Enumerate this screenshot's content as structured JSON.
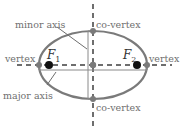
{
  "diagram": {
    "colors": {
      "ellipse": "#7a7a7a",
      "axes": "#6e6e6e",
      "foci": "#111111",
      "points": "#7a7a7a",
      "label": "#6f6f6f",
      "background": "#ffffff"
    },
    "ellipse": {
      "cx": 93,
      "cy": 65,
      "rx": 54,
      "ry": 34
    },
    "labels": {
      "minor_axis": "minor axis",
      "major_axis": "major axis",
      "vertex_left": "vertex",
      "vertex_right": "vertex",
      "co_vertex_top": "co-vertex",
      "co_vertex_bottom": "co-vertex",
      "focus1": {
        "letter": "F",
        "subscript": "1"
      },
      "focus2": {
        "letter": "F",
        "subscript": "2"
      }
    },
    "points": [
      {
        "name": "vertex-left",
        "x": 39,
        "y": 65
      },
      {
        "name": "vertex-right",
        "x": 147,
        "y": 65
      },
      {
        "name": "co-vertex-top",
        "x": 93,
        "y": 31
      },
      {
        "name": "co-vertex-bottom",
        "x": 93,
        "y": 99
      },
      {
        "name": "center",
        "x": 93,
        "y": 65
      },
      {
        "name": "focus-1",
        "x": 49,
        "y": 65
      },
      {
        "name": "focus-2",
        "x": 137,
        "y": 65
      }
    ]
  }
}
